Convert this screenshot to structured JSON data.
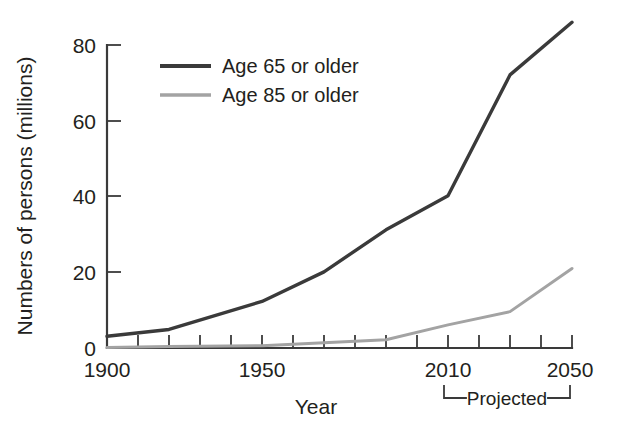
{
  "chart_data": {
    "type": "line",
    "title": "",
    "subtitle": "",
    "xlabel": "Year",
    "ylabel": "Numbers of persons (millions)",
    "xlim": [
      1900,
      2050
    ],
    "ylim": [
      0,
      88
    ],
    "grid": false,
    "legend_position": "top-left-inside",
    "x_tick_labels": [
      "1900",
      "1950",
      "2010",
      "2050"
    ],
    "x_tick_label_values": [
      1900,
      1950,
      2010,
      2050
    ],
    "x_minor_ticks": [
      1900,
      1910,
      1920,
      1930,
      1940,
      1950,
      1960,
      1970,
      1980,
      1990,
      2000,
      2010,
      2020,
      2030,
      2040,
      2050
    ],
    "y_tick_labels": [
      "0",
      "20",
      "40",
      "60",
      "80"
    ],
    "y_tick_values": [
      0,
      20,
      40,
      60,
      80
    ],
    "annotation": "Projected",
    "annotation_range": [
      2010,
      2050
    ],
    "series": [
      {
        "name": "Age 65 or older",
        "color": "#3a3a3a",
        "x": [
          1900,
          1920,
          1950,
          1970,
          1990,
          2010,
          2030,
          2050
        ],
        "values": [
          3.1,
          4.9,
          12.3,
          20.1,
          31.2,
          40.2,
          72.1,
          86.0
        ]
      },
      {
        "name": "Age 85 or older",
        "color": "#a3a3a3",
        "x": [
          1900,
          1920,
          1950,
          1970,
          1990,
          2010,
          2030,
          2050
        ],
        "values": [
          0.1,
          0.4,
          0.6,
          1.4,
          2.2,
          6.1,
          9.6,
          21.0
        ]
      }
    ]
  },
  "legend": {
    "items": [
      {
        "label": "Age 65 or older",
        "color": "#3a3a3a",
        "width": 4.2
      },
      {
        "label": "Age 85 or older",
        "color": "#a3a3a3",
        "width": 3.4
      }
    ]
  },
  "axes": {
    "y_title": "Numbers of persons (millions)",
    "x_title": "Year",
    "y_ticks": [
      "80",
      "60",
      "40",
      "20",
      "0"
    ],
    "x_ticks": [
      "1900",
      "1950",
      "2010",
      "2050"
    ]
  },
  "annotations": {
    "projected": "Projected"
  }
}
